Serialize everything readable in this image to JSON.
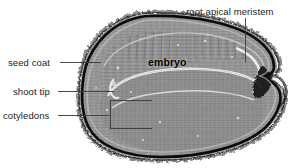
{
  "figure": {
    "background_color": "#ffffff",
    "width": 295,
    "height": 168
  },
  "labels": {
    "seed_coat": "seed coat",
    "shoot_tip": "shoot tip",
    "cotyledons": "cotyledons",
    "root_apical_meristem": "root apical meristem",
    "embryo": "embryo"
  },
  "colors": {
    "text": "#1b1b1b",
    "leader_line": "#3a3a3a",
    "seed_coat_dark": "#0d0d0d",
    "endosperm_gray": "#9a9a9a",
    "embryo_gray": "#8e8e8e",
    "highlight_line": "#f2f2f2",
    "background": "#ffffff"
  },
  "structures": {
    "seed_coat_description": "dark outer band with fuzzy hair-like outer margin",
    "interior_texture": "fine horizontal striations of cell rows",
    "notch_side": "right"
  }
}
